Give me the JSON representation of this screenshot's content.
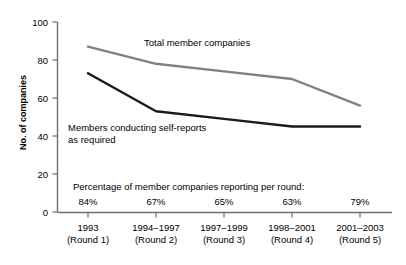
{
  "chart_data": {
    "type": "line",
    "title": "",
    "xlabel": "",
    "ylabel": "No. of companies",
    "ylim": [
      0,
      100
    ],
    "yticks": [
      0,
      20,
      40,
      60,
      80,
      100
    ],
    "grid": false,
    "legend_position": "inline-annotations",
    "categories": [
      "1993 (Round 1)",
      "1994–1997 (Round 2)",
      "1997–1999 (Round 3)",
      "1998–2001 (Round 4)",
      "2001–2003 (Round 5)"
    ],
    "category_lines": [
      {
        "top": "1993",
        "bottom": "(Round 1)"
      },
      {
        "top": "1994–1997",
        "bottom": "(Round 2)"
      },
      {
        "top": "1997–1999",
        "bottom": "(Round 3)"
      },
      {
        "top": "1998–2001",
        "bottom": "(Round 4)"
      },
      {
        "top": "2001–2003",
        "bottom": "(Round 5)"
      }
    ],
    "series": [
      {
        "name": "Total member companies",
        "color": "#808080",
        "values": [
          87,
          78,
          74,
          70,
          56
        ]
      },
      {
        "name": "Members conducting self-reports as required",
        "color": "#1a1a1a",
        "values": [
          73,
          53,
          49,
          45,
          45
        ]
      }
    ],
    "annotations": {
      "total_label": "Total member companies",
      "selfreports_label_line1": "Members conducting self-reports",
      "selfreports_label_line2": "as required",
      "percentage_caption": "Percentage of member companies reporting per round:",
      "percentages": [
        "84%",
        "67%",
        "65%",
        "63%",
        "79%"
      ]
    }
  },
  "axis": {
    "y_tick_labels": [
      "100",
      "80",
      "60",
      "40",
      "20",
      "0"
    ],
    "y_title": "No. of companies"
  },
  "colors": {
    "axis": "#6e6e6e",
    "total_series": "#808080",
    "selfreport_series": "#1a1a1a",
    "text": "#000000",
    "background": "#ffffff"
  }
}
